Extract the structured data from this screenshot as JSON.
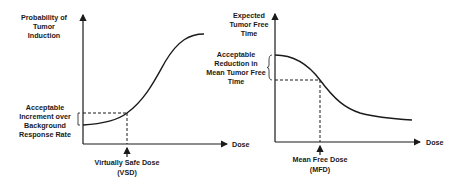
{
  "left_panel": {
    "y_label": [
      "Probability of",
      "Tumor",
      "Induction"
    ],
    "x_label": "Dose",
    "annotation": [
      "Acceptable",
      "Increment over",
      "Background",
      "Response Rate"
    ],
    "marker_label": "Virtually Safe Dose",
    "marker_abbrev": "(VSD)"
  },
  "right_panel": {
    "y_label": [
      "Expected",
      "Tumor Free",
      "Time"
    ],
    "x_label": "Dose",
    "annotation": [
      "Acceptable",
      "Reduction in",
      "Mean Tumor Free",
      "Time"
    ],
    "marker_label": "Mean Free Dose",
    "marker_abbrev": "(MFD)"
  },
  "colors": {
    "ink": "#1a1a1a",
    "background": "#ffffff"
  }
}
